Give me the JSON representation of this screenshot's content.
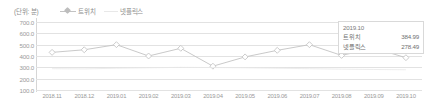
{
  "unit_label": "(단위: 분)",
  "legend": [
    {
      "name": "twitch",
      "label": "트위치",
      "marker": "line-diamond-marker",
      "color": "#c3c3c3"
    },
    {
      "name": "netflix",
      "label": "넷플릭스",
      "marker": "line-marker",
      "color": "#e8e8e8"
    }
  ],
  "tooltip": {
    "title": "2019.10",
    "rows": [
      {
        "label": "트위치",
        "value": "384.99"
      },
      {
        "label": "넷플릭스",
        "value": "278.49"
      }
    ]
  },
  "chart_data": {
    "type": "line",
    "title": "",
    "xlabel": "",
    "ylabel": "(단위: 분)",
    "ylim": [
      100.0,
      700.0
    ],
    "ytick_labels": [
      "700.0",
      "600.0",
      "500.0",
      "400.0",
      "300.0",
      "200.0",
      "100.0"
    ],
    "yticks": [
      700.0,
      600.0,
      500.0,
      400.0,
      300.0,
      200.0,
      100.0
    ],
    "grid": true,
    "legend_position": "top-left",
    "categories": [
      "2018.11",
      "2018.12",
      "2019.01",
      "2019.02",
      "2019.03",
      "2019.04",
      "2019.05",
      "2019.06",
      "2019.07",
      "2019.08",
      "2019.09",
      "2019.10"
    ],
    "series": [
      {
        "name": "트위치",
        "color": "#c3c3c3",
        "values": [
          432.0,
          455.0,
          500.0,
          400.0,
          468.0,
          310.0,
          392.0,
          450.0,
          500.0,
          405.0,
          470.0,
          384.99
        ]
      },
      {
        "name": "넷플릭스",
        "color": "#e8e8e8",
        "values": [
          288.0,
          286.0,
          292.0,
          296.0,
          300.0,
          298.0,
          296.0,
          292.0,
          288.0,
          284.0,
          281.0,
          278.49
        ]
      }
    ]
  }
}
